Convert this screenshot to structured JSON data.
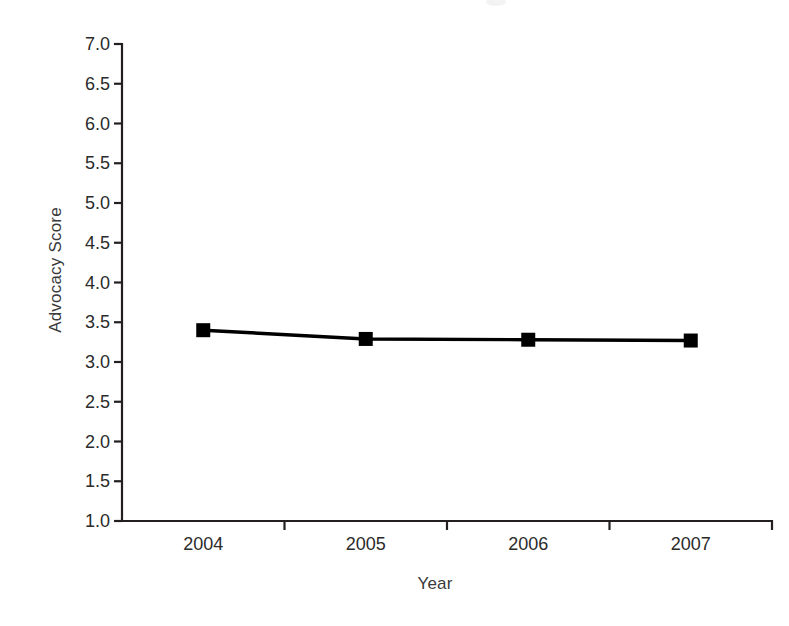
{
  "chart_data": {
    "type": "line",
    "title": "",
    "subtitle": "",
    "xlabel": "Year",
    "ylabel": "Advocacy Score",
    "categories": [
      "2004",
      "2005",
      "2006",
      "2007"
    ],
    "series": [
      {
        "name": "Advocacy Score",
        "values": [
          3.4,
          3.29,
          3.28,
          3.27
        ],
        "color": "#000000",
        "marker": "square"
      }
    ],
    "ylim": [
      1.0,
      7.0
    ],
    "ytick_step": 0.5,
    "ytick_labels": [
      "7.0",
      "6.5",
      "6.0",
      "5.5",
      "5.0",
      "4.5",
      "4.0",
      "3.5",
      "3.0",
      "2.5",
      "2.0",
      "1.5",
      "1.0"
    ],
    "ytick_values": [
      7.0,
      6.5,
      6.0,
      5.5,
      5.0,
      4.5,
      4.0,
      3.5,
      3.0,
      2.5,
      2.0,
      1.5,
      1.0
    ],
    "xtick_labels": [
      "2004",
      "2005",
      "2006",
      "2007"
    ],
    "grid": false,
    "legend": false,
    "legend_position": "none",
    "background_color": "#ffffff",
    "axis_color": "#231f20",
    "tick_placement": "category-boundaries",
    "annotations": []
  },
  "axes": {
    "y_title": "Advocacy Score",
    "x_title": "Year"
  }
}
